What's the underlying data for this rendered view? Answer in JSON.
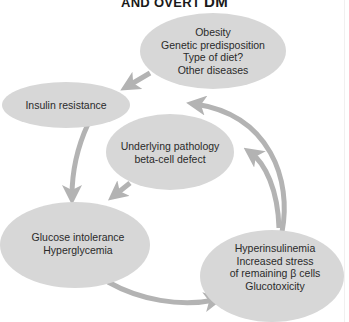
{
  "title": {
    "text": "AND OVERT ",
    "suffix": "DM"
  },
  "colors": {
    "node_fill": "#d7d7d7",
    "arrow": "#b3b3b3",
    "text": "#2a2a2a"
  },
  "nodes": {
    "risk_factors": {
      "lines": [
        "Obesity",
        "Genetic predisposition",
        "Type of diet?",
        "Other diseases"
      ]
    },
    "insulin_resistance": {
      "lines": [
        "Insulin resistance"
      ]
    },
    "underlying_pathology": {
      "lines": [
        "Underlying pathology",
        "beta-cell defect"
      ]
    },
    "glucose_intolerance": {
      "lines": [
        "Glucose intolerance",
        "Hyperglycemia"
      ]
    },
    "hyperinsulinemia": {
      "lines": [
        "Hyperinsulinemia",
        "Increased stress",
        "of remaining β cells",
        "Glucotoxicity"
      ]
    }
  },
  "edges": [
    {
      "from": "risk_factors",
      "to": "insulin_resistance"
    },
    {
      "from": "insulin_resistance",
      "to": "glucose_intolerance"
    },
    {
      "from": "underlying_pathology",
      "to": "glucose_intolerance"
    },
    {
      "from": "glucose_intolerance",
      "to": "hyperinsulinemia"
    },
    {
      "from": "hyperinsulinemia",
      "to": "insulin_resistance"
    },
    {
      "from": "hyperinsulinemia",
      "to": "underlying_pathology"
    }
  ]
}
